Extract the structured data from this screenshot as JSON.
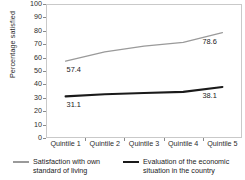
{
  "chart_data": {
    "type": "line",
    "title": "",
    "xlabel": "",
    "ylabel": "Percentage satisfied",
    "categories": [
      "Quintile 1",
      "Quintile 2",
      "Quintile 3",
      "Quintile 4",
      "Quintile 5"
    ],
    "ylim": [
      0,
      100
    ],
    "ytick_values": [
      0,
      10,
      20,
      30,
      40,
      50,
      60,
      70,
      80,
      90,
      100
    ],
    "ytick_labels": [
      "0",
      "10",
      "20",
      "30",
      "40",
      "50",
      "60",
      "70",
      "80",
      "90",
      "100"
    ],
    "grid": false,
    "legend_position": "bottom",
    "series": [
      {
        "name": "Satisfaction with own standard of living",
        "color": "#9a9a9a",
        "values": [
          57.4,
          64.2,
          68.6,
          71.4,
          78.6
        ],
        "point_labels": [
          {
            "index": 0,
            "text": "57.4"
          },
          {
            "index": 4,
            "text": "78.6"
          }
        ]
      },
      {
        "name": "Evaluation of the economic situation in the country",
        "color": "#1a1a1a",
        "values": [
          31.1,
          32.6,
          33.6,
          34.4,
          38.1
        ],
        "point_labels": [
          {
            "index": 0,
            "text": "31.1"
          },
          {
            "index": 4,
            "text": "38.1"
          }
        ]
      }
    ]
  },
  "legend": {
    "entries": [
      {
        "label": "Satisfaction with own standard of living",
        "color": "#9a9a9a"
      },
      {
        "label": "Evaluation of the economic situation in the country",
        "color": "#1a1a1a"
      }
    ]
  }
}
